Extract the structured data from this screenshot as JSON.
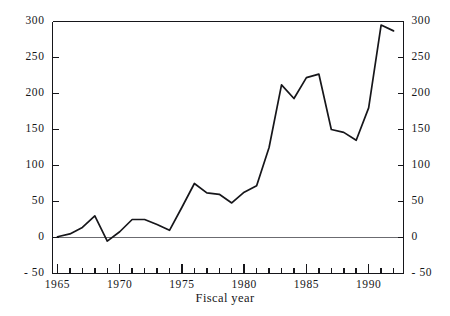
{
  "chart_data": {
    "type": "line",
    "title": "",
    "xlabel": "Fiscal year",
    "ylabel": "",
    "xlim": [
      1964.6,
      1992.8
    ],
    "ylim": [
      -50,
      300
    ],
    "grid": false,
    "legend": "none",
    "y_ticks": [
      -50,
      0,
      50,
      100,
      150,
      200,
      250,
      300
    ],
    "y_tick_labels": [
      "- 50",
      "0",
      "50",
      "100",
      "150",
      "200",
      "250",
      "300"
    ],
    "y_axis_mirrored": true,
    "x_ticks_major": [
      1965,
      1970,
      1975,
      1980,
      1985,
      1990
    ],
    "x_tick_labels": [
      "1965",
      "1970",
      "1975",
      "1980",
      "1985",
      "1990"
    ],
    "x_ticks_minor_every": 1,
    "zero_reference_line": 0,
    "line_color": "#16161a",
    "axis_color": "#16161a",
    "zero_line_color": "#6b6b70",
    "x": [
      1965,
      1966,
      1967,
      1968,
      1969,
      1970,
      1971,
      1972,
      1973,
      1974,
      1975,
      1976,
      1977,
      1978,
      1979,
      1980,
      1981,
      1982,
      1983,
      1984,
      1985,
      1986,
      1987,
      1988,
      1989,
      1990,
      1991,
      1992
    ],
    "values": [
      1,
      5,
      14,
      30,
      -5,
      8,
      25,
      25,
      18,
      10,
      42,
      75,
      62,
      60,
      48,
      63,
      72,
      125,
      212,
      193,
      222,
      227,
      150,
      146,
      135,
      180,
      295,
      287
    ]
  },
  "axis_titles": {
    "x": "Fiscal year"
  }
}
